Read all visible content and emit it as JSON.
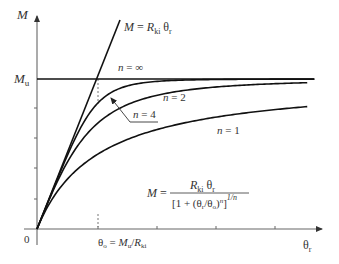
{
  "figure": {
    "y_axis_label": "M",
    "x_axis_label": "θr",
    "origin_label": "0",
    "mu_label": "Mu",
    "elastic_line_label": "M = Rki θr",
    "theta_o_label": "θo = Mu/Rki",
    "formula": {
      "lhs": "M =",
      "numerator": "Rki θr",
      "denominator": "[1 + (θr/θo)^n]",
      "exponent": "1/n"
    },
    "curve_labels": {
      "n_inf": "n = ∞",
      "n_4": "n = 4",
      "n_2": "n = 2",
      "n_1": "n = 1"
    }
  },
  "chart_data": {
    "type": "line",
    "xlabel": "θr",
    "ylabel": "M",
    "x_normalized": "θr/θo",
    "y_normalized": "M/Mu",
    "xlim": [
      0,
      4.6
    ],
    "ylim": [
      0,
      1.4
    ],
    "x_ticks": [
      1,
      2,
      3,
      4
    ],
    "y_ticks": [
      0.2,
      0.4,
      0.6,
      0.8,
      1.0
    ],
    "reference_lines": [
      {
        "name": "M = Rki θr",
        "kind": "line",
        "slope": 1
      },
      {
        "name": "Mu",
        "kind": "horizontal",
        "y": 1.0
      },
      {
        "name": "θo = Mu/Rki",
        "kind": "vertical-dotted",
        "x": 1.0
      }
    ],
    "series": [
      {
        "name": "n = ∞",
        "n": "inf",
        "x": [
          0,
          1,
          4.6
        ],
        "values": [
          0,
          1.0,
          1.0
        ]
      },
      {
        "name": "n = 4",
        "n": 4,
        "x": [
          0,
          0.5,
          1,
          1.5,
          2,
          3,
          4.43
        ],
        "values": [
          0,
          0.5,
          0.84,
          0.97,
          0.99,
          1.0,
          1.0
        ]
      },
      {
        "name": "n = 2",
        "n": 2,
        "x": [
          0,
          0.5,
          1,
          1.5,
          2,
          3,
          4.43
        ],
        "values": [
          0,
          0.45,
          0.71,
          0.83,
          0.89,
          0.95,
          0.98
        ]
      },
      {
        "name": "n = 1",
        "n": 1,
        "x": [
          0,
          0.5,
          1,
          1.5,
          2,
          3,
          4.43
        ],
        "values": [
          0,
          0.33,
          0.5,
          0.6,
          0.67,
          0.75,
          0.82
        ]
      }
    ],
    "colors": {
      "curves": "#111111",
      "axes": "#555555"
    }
  }
}
